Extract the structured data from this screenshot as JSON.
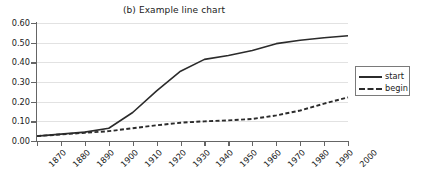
{
  "chart_data": {
    "type": "line",
    "title": "(b) Example line chart",
    "xlabel": "",
    "ylabel": "",
    "grid": "horizontal",
    "legend_position": "right",
    "x": [
      1870,
      1880,
      1890,
      1900,
      1910,
      1920,
      1930,
      1940,
      1950,
      1960,
      1970,
      1980,
      1990,
      2000
    ],
    "xtick_labels": [
      "1870",
      "1880",
      "1890",
      "1900",
      "1910",
      "1920",
      "1930",
      "1940",
      "1950",
      "1960",
      "1970",
      "1980",
      "1990",
      "2000"
    ],
    "xlim": [
      1870,
      2000
    ],
    "ylim": [
      0.0,
      0.6
    ],
    "ytick_labels": [
      "0.00",
      "0.10",
      "0.20",
      "0.30",
      "0.40",
      "0.50",
      "0.60"
    ],
    "ytick_values": [
      0.0,
      0.1,
      0.2,
      0.3,
      0.4,
      0.5,
      0.6
    ],
    "series": [
      {
        "name": "start",
        "style": "solid",
        "color": "#2b2b2b",
        "values": [
          0.025,
          0.035,
          0.045,
          0.065,
          0.145,
          0.255,
          0.355,
          0.415,
          0.435,
          0.46,
          0.495,
          0.512,
          0.525,
          0.535
        ]
      },
      {
        "name": "begin",
        "style": "dashed",
        "color": "#2b2b2b",
        "values": [
          0.025,
          0.033,
          0.042,
          0.05,
          0.065,
          0.08,
          0.093,
          0.1,
          0.105,
          0.112,
          0.13,
          0.155,
          0.19,
          0.222
        ]
      }
    ]
  },
  "legend": {
    "entries": [
      {
        "label": "start"
      },
      {
        "label": "begin"
      }
    ]
  },
  "colors": {
    "line": "#2b2b2b",
    "grid": "#e2e2e2",
    "axis": "#656565",
    "text": "#1a1a1a",
    "background": "#ffffff"
  }
}
